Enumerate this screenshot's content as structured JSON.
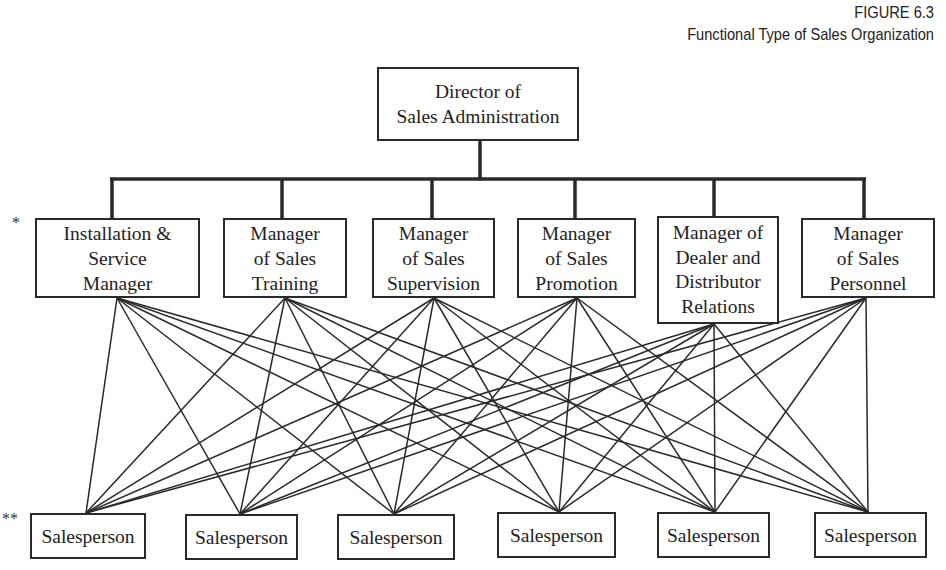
{
  "caption": {
    "figure_number": "FIGURE 6.3",
    "title": "Functional Type of Sales Organization"
  },
  "director": {
    "label": "Director of\nSales Administration"
  },
  "managers": [
    {
      "label": "Installation &\nService\nManager"
    },
    {
      "label": "Manager\nof Sales\nTraining"
    },
    {
      "label": "Manager\nof Sales\nSupervision"
    },
    {
      "label": "Manager\nof Sales\nPromotion"
    },
    {
      "label": "Manager of\nDealer and\nDistributor\nRelations"
    },
    {
      "label": "Manager\nof Sales\nPersonnel"
    }
  ],
  "salespeople": [
    {
      "label": "Salesperson"
    },
    {
      "label": "Salesperson"
    },
    {
      "label": "Salesperson"
    },
    {
      "label": "Salesperson"
    },
    {
      "label": "Salesperson"
    },
    {
      "label": "Salesperson"
    }
  ],
  "markers": {
    "manager_row": "*",
    "salesperson_row": "**"
  },
  "colors": {
    "line": "#2a2a2a",
    "text": "#1e1e1e",
    "background": "#ffffff"
  }
}
